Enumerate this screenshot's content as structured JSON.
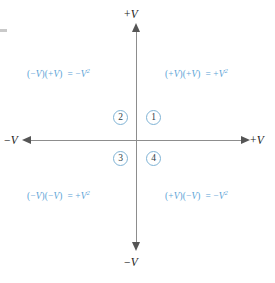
{
  "figure": {
    "accent_color": "#5ba3d6",
    "axis_color": "#8d8d8d",
    "arrow_color": "#555555",
    "circle_border_color": "#7fb3d5",
    "number_color": "#2b3c46"
  },
  "axes": {
    "top_label": "+V",
    "bottom_label": "−V",
    "left_label": "−V",
    "right_label": "+V",
    "top_sign": "+",
    "bottom_sign": "−",
    "left_sign": "−",
    "right_sign": "+",
    "variable": "V"
  },
  "quadrants": [
    {
      "number": "1",
      "position": "top-right",
      "equation": "(+V)(+V) = +V²",
      "factor_a_sign": "+",
      "factor_b_sign": "+",
      "result_sign": "+",
      "variable": "V",
      "exponent": "2"
    },
    {
      "number": "2",
      "position": "top-left",
      "equation": "(−V)(+V) = −V²",
      "factor_a_sign": "−",
      "factor_b_sign": "+",
      "result_sign": "−",
      "variable": "V",
      "exponent": "2"
    },
    {
      "number": "3",
      "position": "bottom-left",
      "equation": "(−V)(−V) = +V²",
      "factor_a_sign": "−",
      "factor_b_sign": "−",
      "result_sign": "+",
      "variable": "V",
      "exponent": "2"
    },
    {
      "number": "4",
      "position": "bottom-right",
      "equation": "(+V)(−V) = −V²",
      "factor_a_sign": "+",
      "factor_b_sign": "−",
      "result_sign": "−",
      "variable": "V",
      "exponent": "2"
    }
  ],
  "symbols": {
    "open_paren": "(",
    "close_paren": ")",
    "equals": "="
  }
}
